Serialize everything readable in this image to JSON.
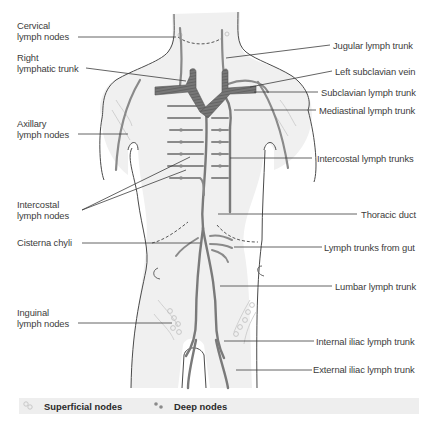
{
  "figure": {
    "colors": {
      "background": "#ffffff",
      "body_fill": "#f0f0f0",
      "outline": "#4a4a4a",
      "vessel": "#8a8a8a",
      "duct": "#707070",
      "superficial_node": "#d8d8d8",
      "legend_bg": "#eeeeee",
      "label_line": "#3c3c3c"
    }
  },
  "labels_left": [
    {
      "id": "cervical",
      "text_line1": "Cervical",
      "text_line2": "lymph nodes"
    },
    {
      "id": "right-lymphatic-trunk",
      "text_line1": "Right",
      "text_line2": "lymphatic trunk"
    },
    {
      "id": "axillary",
      "text_line1": "Axillary",
      "text_line2": "lymph nodes"
    },
    {
      "id": "intercostal-nodes",
      "text_line1": "Intercostal",
      "text_line2": "lymph nodes"
    },
    {
      "id": "cisterna-chyli",
      "text_line1": "Cisterna chyli"
    },
    {
      "id": "inguinal",
      "text_line1": "Inguinal",
      "text_line2": "lymph nodes"
    }
  ],
  "labels_right": [
    {
      "id": "jugular",
      "text": "Jugular lymph trunk"
    },
    {
      "id": "left-subclavian-vein",
      "text": "Left subclavian vein"
    },
    {
      "id": "subclavian-trunk",
      "text": "Subclavian lymph trunk"
    },
    {
      "id": "mediastinal",
      "text": "Mediastinal lymph trunk"
    },
    {
      "id": "intercostal-trunks",
      "text": "Intercostal lymph trunks"
    },
    {
      "id": "thoracic-duct",
      "text": "Thoracic duct"
    },
    {
      "id": "gut-trunks",
      "text": "Lymph trunks from gut"
    },
    {
      "id": "lumbar",
      "text": "Lumbar lymph trunk"
    },
    {
      "id": "internal-iliac",
      "text": "Internal iliac lymph trunk"
    },
    {
      "id": "external-iliac",
      "text": "External iliac lymph trunk"
    }
  ],
  "legend": {
    "items": [
      {
        "icon": "superficial-node-icon",
        "label": "Superficial nodes"
      },
      {
        "icon": "deep-node-icon",
        "label": "Deep nodes"
      }
    ]
  }
}
